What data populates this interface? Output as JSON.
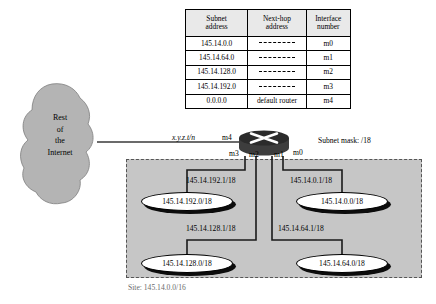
{
  "routing_table": {
    "headers": [
      {
        "line1": "Subnet",
        "line2": "address"
      },
      {
        "line1": "Next-hop",
        "line2": "address"
      },
      {
        "line1": "Interface",
        "line2": "number"
      }
    ],
    "rows": [
      {
        "subnet": "145.14.0.0",
        "nexthop": "",
        "iface": "m0"
      },
      {
        "subnet": "145.14.64.0",
        "nexthop": "",
        "iface": "m1"
      },
      {
        "subnet": "145.14.128.0",
        "nexthop": "",
        "iface": "m2"
      },
      {
        "subnet": "145.14.192.0",
        "nexthop": "",
        "iface": "m3"
      },
      {
        "subnet": "0.0.0.0",
        "nexthop": "default router",
        "iface": "m4"
      }
    ]
  },
  "cloud": {
    "label_lines": [
      "Rest",
      "of",
      "the",
      "Internet"
    ],
    "fill_color": "#b4b4b4"
  },
  "router": {
    "top_fill": "#2b2b2b",
    "body_fill": "#3d3d3d",
    "x_mark_color": "#ffffff",
    "interfaces": {
      "m4": "m4",
      "m3": "m3",
      "m2": "m2",
      "m1": "m1",
      "m0": "m0"
    }
  },
  "labels": {
    "wan_address": "x.y.z.t/n",
    "subnet_mask": "Subnet mask: /18",
    "site_caption": "Site: 145.14.0.0/16"
  },
  "interface_addresses": {
    "m3": "145.14.192.1/18",
    "m2": "145.14.128.1/18",
    "m1": "145.14.64.1/18",
    "m0": "145.14.0.1/18"
  },
  "subnets": [
    {
      "id": "subnet-192",
      "label": "145.14.192.0/18"
    },
    {
      "id": "subnet-0",
      "label": "145.14.0.0/18"
    },
    {
      "id": "subnet-128",
      "label": "145.14.128.0/18"
    },
    {
      "id": "subnet-64",
      "label": "145.14.64.0/18"
    }
  ],
  "site": {
    "fill_color": "#c6c6c6",
    "border_color": "#555555"
  }
}
